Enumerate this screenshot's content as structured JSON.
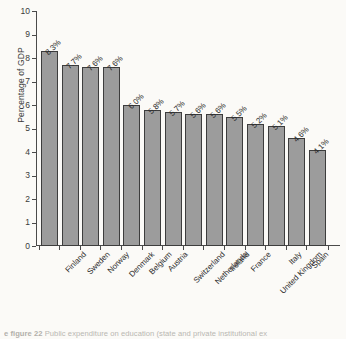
{
  "chart_data": {
    "type": "bar",
    "title": "",
    "xlabel": "",
    "ylabel": "Percentage of GDP",
    "ylim": [
      0,
      10
    ],
    "ytick_labels": [
      "10",
      "9",
      "8",
      "7",
      "6",
      "5",
      "4",
      "3",
      "2",
      "1",
      "0"
    ],
    "grid": false,
    "legend": "none",
    "categories": [
      "Finland",
      "Sweden",
      "Norway",
      "Denmark",
      "Belgium",
      "Austria",
      "Switzerland",
      "Netherlands",
      "Ireland",
      "France",
      "United Kingdom",
      "Italy",
      "Spain",
      "Germany (former FRG)"
    ],
    "values": [
      8.3,
      7.7,
      7.6,
      7.6,
      6.0,
      5.8,
      5.7,
      5.6,
      5.6,
      5.5,
      5.2,
      5.1,
      4.6,
      4.1
    ],
    "value_labels": [
      "8.3%",
      "7.7%",
      "7.6%",
      "7.6%",
      "6.0%",
      "5.8%",
      "5.7%",
      "5.6%",
      "5.6%",
      "5.5%",
      "5.2%",
      "5.1%",
      "4.6%",
      "4.1%"
    ],
    "bar_color": "#9c9c9c",
    "bar_edge_color": "#3d3d3d"
  },
  "caption": {
    "prefix": "e figure 22",
    "text": "Public expenditure on education (state and private institutional ex"
  }
}
